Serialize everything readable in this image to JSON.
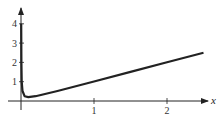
{
  "chart_data": {
    "type": "line",
    "title": "",
    "xlabel": "x",
    "ylabel": "",
    "xlim": [
      0,
      2.6
    ],
    "ylim": [
      0,
      4.5
    ],
    "x_ticks": [
      "1",
      "2"
    ],
    "y_ticks": [
      "1",
      "2",
      "3",
      "4"
    ],
    "grid": false,
    "legend": null,
    "series": [
      {
        "name": "y = x + 0.01/x",
        "x": [
          0.0025,
          0.005,
          0.01,
          0.02,
          0.05,
          0.1,
          0.2,
          0.5,
          1,
          1.5,
          2,
          2.5
        ],
        "values": [
          4.0025,
          2.005,
          1.01,
          0.52,
          0.25,
          0.2,
          0.25,
          0.52,
          1.01,
          1.507,
          2.005,
          2.504
        ]
      }
    ]
  }
}
